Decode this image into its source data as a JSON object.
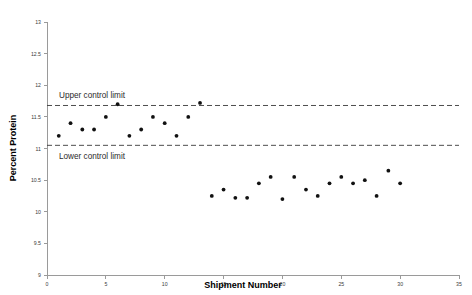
{
  "chart_data": {
    "type": "scatter",
    "title": "",
    "xlabel": "Shipment Number",
    "ylabel": "Percent Protein",
    "xlim": [
      0,
      35
    ],
    "ylim": [
      9,
      13
    ],
    "xticks": [
      0,
      5,
      10,
      15,
      20,
      25,
      30,
      35
    ],
    "xtick_labels": [
      "0",
      "5",
      "10",
      "15",
      "20",
      "25",
      "30",
      "35"
    ],
    "yticks": [
      9,
      9.5,
      10,
      10.5,
      11,
      11.5,
      12,
      12.5,
      13
    ],
    "ytick_labels": [
      "9",
      "9.5",
      "10",
      "10.5",
      "11",
      "11.5",
      "12",
      "12.5",
      "13"
    ],
    "grid": false,
    "legend": "none",
    "series": [
      {
        "name": "Percent Protein",
        "marker": "filled-circle",
        "color": "#111111",
        "points": [
          {
            "x": 1,
            "y": 11.2
          },
          {
            "x": 2,
            "y": 11.4
          },
          {
            "x": 3,
            "y": 11.3
          },
          {
            "x": 4,
            "y": 11.3
          },
          {
            "x": 5,
            "y": 11.5
          },
          {
            "x": 6,
            "y": 11.7
          },
          {
            "x": 7,
            "y": 11.2
          },
          {
            "x": 8,
            "y": 11.3
          },
          {
            "x": 9,
            "y": 11.5
          },
          {
            "x": 10,
            "y": 11.4
          },
          {
            "x": 11,
            "y": 11.2
          },
          {
            "x": 12,
            "y": 11.5
          },
          {
            "x": 13,
            "y": 11.72
          },
          {
            "x": 14,
            "y": 10.25
          },
          {
            "x": 15,
            "y": 10.35
          },
          {
            "x": 16,
            "y": 10.22
          },
          {
            "x": 17,
            "y": 10.22
          },
          {
            "x": 18,
            "y": 10.45
          },
          {
            "x": 19,
            "y": 10.55
          },
          {
            "x": 20,
            "y": 10.2
          },
          {
            "x": 21,
            "y": 10.55
          },
          {
            "x": 22,
            "y": 10.35
          },
          {
            "x": 23,
            "y": 10.25
          },
          {
            "x": 24,
            "y": 10.45
          },
          {
            "x": 25,
            "y": 10.55
          },
          {
            "x": 26,
            "y": 10.45
          },
          {
            "x": 27,
            "y": 10.5
          },
          {
            "x": 28,
            "y": 10.25
          },
          {
            "x": 29,
            "y": 10.65
          },
          {
            "x": 30,
            "y": 10.45
          }
        ]
      }
    ],
    "control_limits": [
      {
        "name": "upper-control-limit",
        "label": "Upper control limit",
        "value": 11.68,
        "style": "dashed"
      },
      {
        "name": "lower-control-limit",
        "label": "Lower control limit",
        "value": 11.05,
        "style": "dashed"
      }
    ],
    "colors": {
      "axis": "#9a9a9a",
      "marker": "#111111",
      "limit_line": "#3a3a3a",
      "text": "#2b2b2b",
      "background": "#ffffff"
    }
  }
}
